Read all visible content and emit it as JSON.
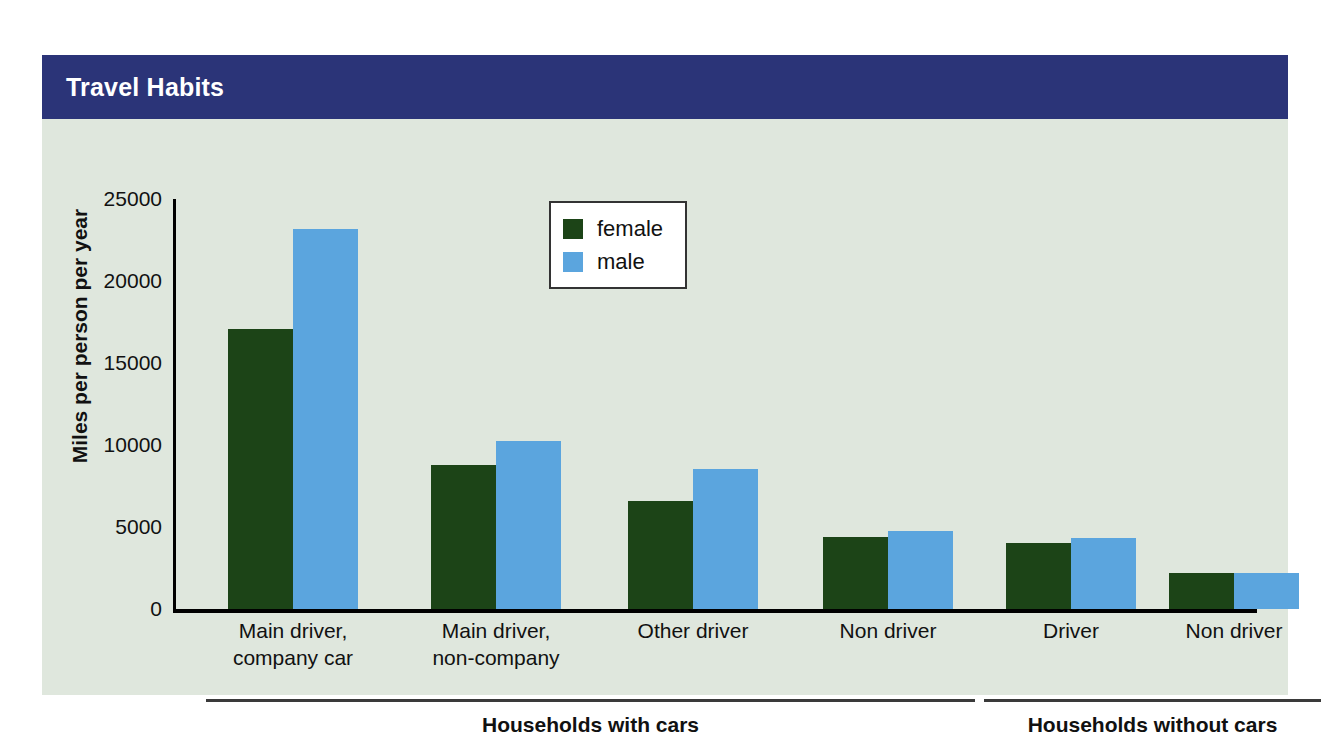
{
  "header": {
    "title": "Travel Habits",
    "bar_color": "#2b3478",
    "text_color": "#ffffff"
  },
  "figure": {
    "background_color": "#dfe7dd"
  },
  "legend": {
    "position": "top-center",
    "entries": [
      {
        "label": "female",
        "color": "#1c4417"
      },
      {
        "label": "male",
        "color": "#5ba5de"
      }
    ]
  },
  "groups": [
    {
      "label": "Households with cars"
    },
    {
      "label": "Households without cars"
    }
  ],
  "chart_data": {
    "type": "bar",
    "title": "Travel Habits",
    "xlabel": "",
    "ylabel": "Miles per person per year",
    "ylim": [
      0,
      25000
    ],
    "yticks": [
      0,
      5000,
      10000,
      15000,
      20000,
      25000
    ],
    "ytick_labels": [
      "0",
      "5000",
      "10000",
      "15000",
      "20000",
      "25000"
    ],
    "grid": false,
    "categories": [
      "Main driver, company car",
      "Main driver, non-company",
      "Other driver",
      "Non driver",
      "Driver",
      "Non driver"
    ],
    "category_lines": [
      [
        "Main driver,",
        "company car"
      ],
      [
        "Main driver,",
        "non-company"
      ],
      [
        "Other driver",
        ""
      ],
      [
        "Non driver",
        ""
      ],
      [
        "Driver",
        ""
      ],
      [
        "Non driver",
        ""
      ]
    ],
    "supergroups": [
      {
        "name": "Households with cars",
        "categories": [
          0,
          1,
          2,
          3
        ]
      },
      {
        "name": "Households without cars",
        "categories": [
          4,
          5
        ]
      }
    ],
    "series": [
      {
        "name": "female",
        "color": "#1c4417",
        "values": [
          17100,
          8800,
          6600,
          4400,
          4000,
          2200
        ]
      },
      {
        "name": "male",
        "color": "#5ba5de",
        "values": [
          23200,
          10250,
          8550,
          4750,
          4350,
          2200
        ]
      }
    ]
  }
}
